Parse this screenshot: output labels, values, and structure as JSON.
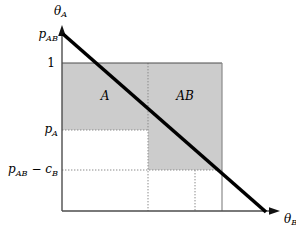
{
  "figure": {
    "axes": {
      "y_axis_label": "θ",
      "y_axis_label_sub": "A",
      "x_axis_label": "θ",
      "x_axis_label_sub": "B"
    },
    "y_ticks": [
      {
        "id": "p_ab",
        "base": "p",
        "sub": "AB",
        "op": "",
        "base2": "",
        "sub2": "",
        "y": 35
      },
      {
        "id": "one",
        "base": "1",
        "sub": "",
        "op": "",
        "base2": "",
        "sub2": "",
        "y": 63
      },
      {
        "id": "p_a",
        "base": "p",
        "sub": "A",
        "op": "",
        "base2": "",
        "sub2": "",
        "y": 130
      },
      {
        "id": "p_ab_min_cb",
        "base": "p",
        "sub": "AB",
        "op": " − ",
        "base2": "c",
        "sub2": "B",
        "y": 170
      }
    ],
    "regions": [
      {
        "id": "region-a",
        "label": "A",
        "x": 105,
        "y": 96,
        "fill": "#cccccc"
      },
      {
        "id": "region-ab",
        "label": "AB",
        "x": 185,
        "y": 96,
        "fill": "#cccccc"
      }
    ],
    "colors": {
      "shade": "#cccccc",
      "line": "#000000",
      "axis": "#555555",
      "grid": "#aaaaaa",
      "background": "#ffffff"
    },
    "geometry": {
      "y_axis_x": 62,
      "x_axis_y": 211,
      "top_line_y": 63,
      "p_a_y": 130,
      "p_ab_cb_y": 170,
      "p_ab_y": 35,
      "v_grid_1_x": 148,
      "v_grid_2_x": 195,
      "frame_right_x": 222,
      "demand_x1": 62,
      "demand_y1": 35,
      "demand_x2": 266,
      "demand_y2": 211
    }
  }
}
